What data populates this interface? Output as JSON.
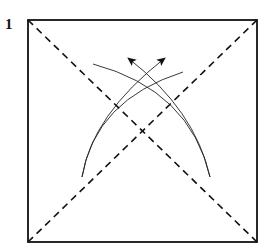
{
  "diagram": {
    "step_number": "1",
    "square": {
      "x": 28,
      "y": 20,
      "size": 229,
      "stroke": "#111111"
    },
    "diagonals": {
      "style": "dashed",
      "meaning": "valley folds"
    },
    "arrows": [
      {
        "name": "fold-arrow-left",
        "from": [
          210,
          177
        ],
        "to": [
          128,
          58
        ]
      },
      {
        "name": "fold-arrow-right",
        "from": [
          82,
          177
        ],
        "to": [
          165,
          58
        ]
      }
    ],
    "arcs": [
      {
        "name": "arc-left-outer",
        "from": [
          210,
          177
        ],
        "to": [
          93,
          64
        ]
      },
      {
        "name": "arc-right-outer",
        "from": [
          82,
          177
        ],
        "to": [
          183,
          72
        ]
      }
    ]
  }
}
